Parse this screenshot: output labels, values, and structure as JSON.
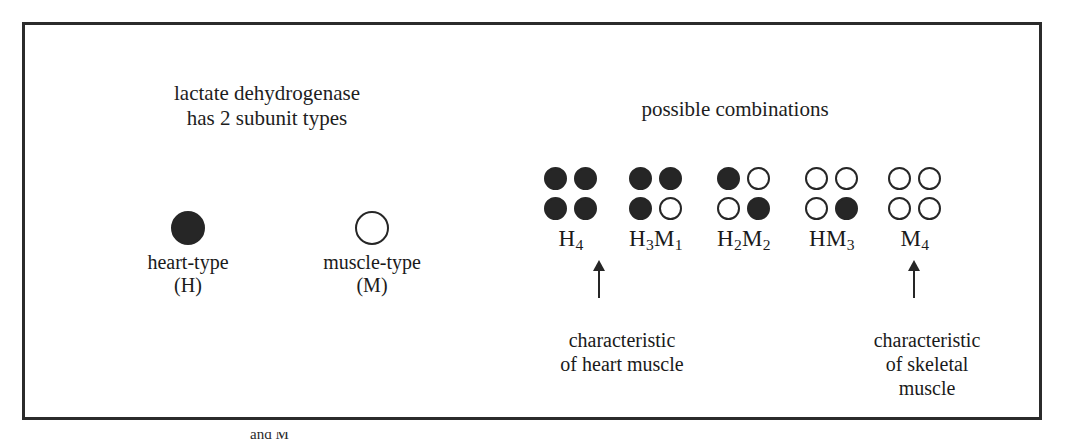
{
  "figure": {
    "headings": {
      "subunits": "lactate dehydrogenase\nhas 2 subunit types",
      "combinations": "possible combinations"
    },
    "legend": [
      {
        "name": "heart-type",
        "label": "heart-type\n(H)",
        "fill": "filled",
        "symbol": "filled-circle"
      },
      {
        "name": "muscle-type",
        "label": "muscle-type\n(M)",
        "fill": "open",
        "symbol": "open-circle"
      }
    ],
    "tetramers": [
      {
        "id": "H4",
        "label": "H",
        "sub1": "4",
        "label2": "",
        "sub2": "",
        "subunits": [
          "H",
          "H",
          "H",
          "H"
        ]
      },
      {
        "id": "H3M1",
        "label": "H",
        "sub1": "3",
        "label2": "M",
        "sub2": "1",
        "subunits": [
          "H",
          "H",
          "H",
          "M"
        ]
      },
      {
        "id": "H2M2",
        "label": "H",
        "sub1": "2",
        "label2": "M",
        "sub2": "2",
        "subunits": [
          "H",
          "M",
          "M",
          "H"
        ]
      },
      {
        "id": "HM3",
        "label": "H",
        "sub1": "",
        "label2": "M",
        "sub2": "3",
        "subunits": [
          "M",
          "M",
          "M",
          "H"
        ]
      },
      {
        "id": "M4",
        "label": "M",
        "sub1": "4",
        "label2": "",
        "sub2": "",
        "subunits": [
          "M",
          "M",
          "M",
          "M"
        ]
      }
    ],
    "callouts": {
      "heart": "characteristic\nof heart muscle",
      "skeletal": "characteristic\nof skeletal\nmuscle"
    },
    "caption_fragment": "and M",
    "colors": {
      "frame": "#2b2b2b",
      "subunit_fill": "#262626",
      "subunit_open": "#ffffff",
      "text": "#1d1d1d"
    }
  }
}
